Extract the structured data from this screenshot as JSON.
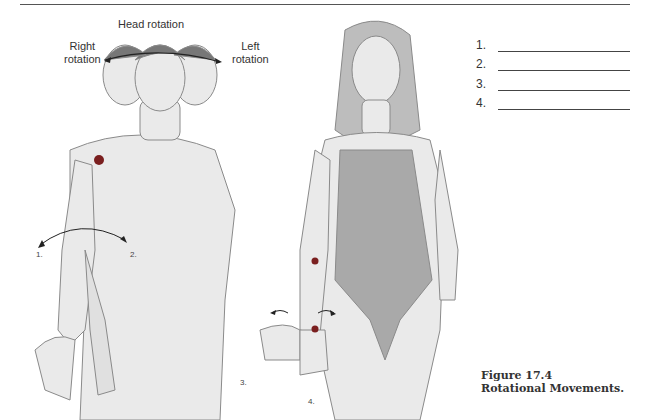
{
  "figure": {
    "number": "Figure 17.4",
    "title": "Rotational Movements."
  },
  "labels": {
    "head_rotation": "Head rotation",
    "right_rotation": [
      "Right",
      "rotation"
    ],
    "left_rotation": [
      "Left",
      "rotation"
    ],
    "arm_markers": [
      "1.",
      "2.",
      "3.",
      "4."
    ]
  },
  "answer_blanks": [
    {
      "number": "1.",
      "value": ""
    },
    {
      "number": "2.",
      "value": ""
    },
    {
      "number": "3.",
      "value": ""
    },
    {
      "number": "4.",
      "value": ""
    }
  ],
  "colors": {
    "skin": "#e8e8e8",
    "outline": "#777777",
    "swimsuit": "#a9a9a9",
    "marker_dot": "#7a1f1f",
    "text": "#333333"
  }
}
